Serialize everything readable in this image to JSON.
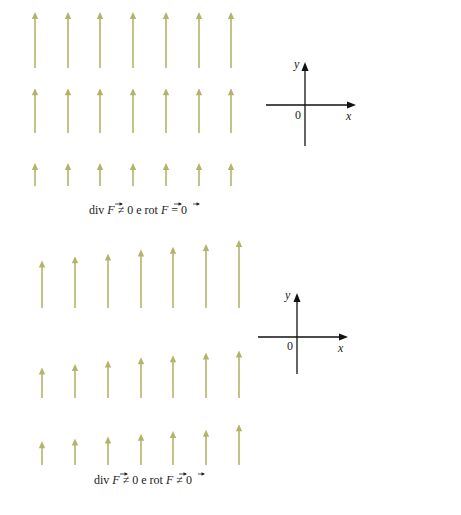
{
  "colors": {
    "arrow": "#b3b46a",
    "axis": "#111111",
    "background": "#ffffff"
  },
  "panels": [
    {
      "id": "top",
      "description": "Uniform-per-row vertical field (varies with y only)",
      "rows": [
        {
          "name": "row-1",
          "lengths": [
            1,
            1,
            1,
            1,
            1,
            1,
            1
          ]
        },
        {
          "name": "row-2",
          "lengths": [
            0.8,
            0.8,
            0.8,
            0.8,
            0.8,
            0.8,
            0.8
          ]
        },
        {
          "name": "row-3",
          "lengths": [
            0.41,
            0.41,
            0.41,
            0.41,
            0.41,
            0.41,
            0.41
          ]
        }
      ],
      "axes": {
        "x_label": "x",
        "y_label": "y",
        "origin_label": "0"
      },
      "caption": {
        "pre": "div ",
        "F1": "F",
        "mid": " ≠ 0 e rot ",
        "F2": "F",
        "rel": " = ",
        "zero": "0"
      }
    },
    {
      "id": "bottom",
      "description": "Vertical field whose length grows with x and y",
      "rows": [
        {
          "name": "row-1",
          "lengths": [
            0.7,
            0.76,
            0.8,
            0.86,
            0.9,
            0.94,
            1.0
          ]
        },
        {
          "name": "row-2",
          "lengths": [
            0.45,
            0.5,
            0.55,
            0.6,
            0.63,
            0.67,
            0.7
          ]
        },
        {
          "name": "row-3",
          "lengths": [
            0.35,
            0.39,
            0.42,
            0.46,
            0.5,
            0.52,
            0.6
          ]
        }
      ],
      "axes": {
        "x_label": "x",
        "y_label": "y",
        "origin_label": "0"
      },
      "caption": {
        "pre": "div ",
        "F1": "F",
        "mid": " ≠ 0 e rot ",
        "F2": "F",
        "rel": " ≠ ",
        "zero": "0"
      }
    }
  ]
}
